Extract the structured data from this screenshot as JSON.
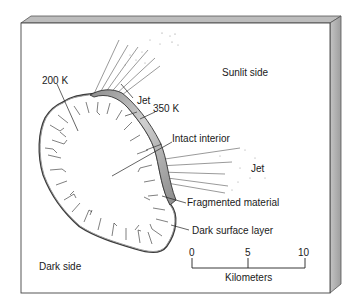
{
  "diagram": {
    "labels": {
      "sunlit_side": "Sunlit side",
      "dark_side": "Dark side",
      "temp_200k": "200 K",
      "temp_350k": "350 K",
      "jet_upper": "Jet",
      "jet_right": "Jet",
      "intact_interior": "Intact interior",
      "fragmented_material": "Fragmented material",
      "dark_surface_layer": "Dark surface layer"
    },
    "scale_bar": {
      "ticks": [
        "0",
        "5",
        "10"
      ],
      "unit": "Kilometers"
    },
    "colors": {
      "outline": "#3a3a3a",
      "shaded_band": "#a8a8a8",
      "box_edge": "#b5b5b5",
      "background": "#ffffff"
    }
  }
}
